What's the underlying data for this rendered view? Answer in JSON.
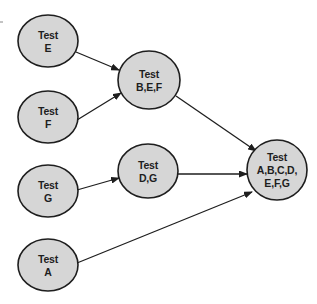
{
  "diagram": {
    "type": "dependency-graph",
    "colors": {
      "node_fill": "#d6d6d6",
      "stroke": "#1e1e1e",
      "background": "#ffffff"
    },
    "nodes": [
      {
        "id": "E",
        "lines": [
          "Test",
          "E"
        ],
        "cx": 48,
        "cy": 41,
        "rx": 30,
        "ry": 26
      },
      {
        "id": "F",
        "lines": [
          "Test",
          "F"
        ],
        "cx": 48,
        "cy": 117,
        "rx": 30,
        "ry": 26
      },
      {
        "id": "G",
        "lines": [
          "Test",
          "G"
        ],
        "cx": 48,
        "cy": 191,
        "rx": 30,
        "ry": 26
      },
      {
        "id": "A",
        "lines": [
          "Test",
          "A"
        ],
        "cx": 48,
        "cy": 265,
        "rx": 30,
        "ry": 26
      },
      {
        "id": "BEF",
        "lines": [
          "Test",
          "B,E,F"
        ],
        "cx": 149,
        "cy": 80,
        "rx": 31,
        "ry": 29
      },
      {
        "id": "DG",
        "lines": [
          "Test",
          "D,G"
        ],
        "cx": 148,
        "cy": 171,
        "rx": 30,
        "ry": 27
      },
      {
        "id": "ALL",
        "lines": [
          "Test",
          "A,B,C,D,",
          "E,F,G"
        ],
        "cx": 277,
        "cy": 170,
        "rx": 30,
        "ry": 30
      }
    ],
    "edges": [
      {
        "from": "E",
        "to": "BEF",
        "x1": 76,
        "y1": 52,
        "x2": 119,
        "y2": 70
      },
      {
        "from": "F",
        "to": "BEF",
        "x1": 77,
        "y1": 120,
        "x2": 121,
        "y2": 93
      },
      {
        "from": "G",
        "to": "DG",
        "x1": 77,
        "y1": 190,
        "x2": 119,
        "y2": 178
      },
      {
        "from": "BEF",
        "to": "ALL",
        "x1": 176,
        "y1": 96,
        "x2": 256,
        "y2": 151
      },
      {
        "from": "DG",
        "to": "ALL",
        "x1": 178,
        "y1": 174,
        "x2": 247,
        "y2": 174
      },
      {
        "from": "A",
        "to": "ALL",
        "x1": 77,
        "y1": 263,
        "x2": 252,
        "y2": 192
      }
    ]
  }
}
